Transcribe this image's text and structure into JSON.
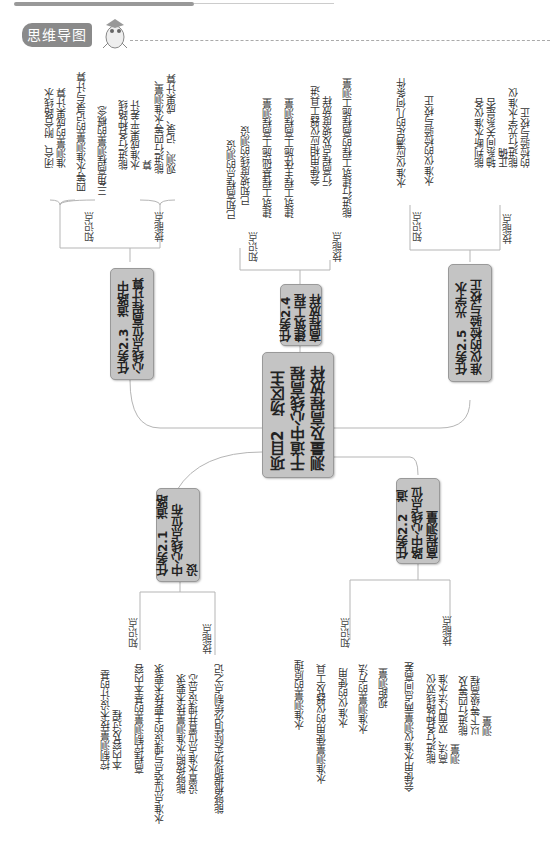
{
  "header": {
    "badge_label": "思维导图",
    "mascot_icon": "mascot-icon"
  },
  "mindmap": {
    "center": {
      "title": "项目2　场区主干道中心线高程测量及高程放样"
    },
    "tasks": [
      {
        "id": "2.3",
        "title": "任务2.3　道路中心线点位高程计算",
        "knowledge_label": "知识点",
        "skill_label": "技能点",
        "knowledge": [
          "闭合、附合路线水准测量的成果计算",
          "四等水准测量的记录与计算",
          "三角高程测量的概念"
        ],
        "skills": [
          "能进行各种路线水准成果平差计算",
          "能进行四等水准测量、观测、记录、成果计算"
        ]
      },
      {
        "id": "2.4",
        "title": "任务2.4　建筑工程高程放样",
        "knowledge_label": "知识点",
        "skill_label": "技能点",
        "knowledge": [
          "已知高程点的测设",
          "已知坡度线的测设",
          "建筑工程基础施工高程测量",
          "建筑工程主体施工高程测量"
        ],
        "skills": [
          "会使用相应仪器工具进行高程点及坡度放样",
          "能进行建筑工程的高程施工测量"
        ]
      },
      {
        "id": "2.5",
        "title": "任务2.5　光学水准仪的检验与校正",
        "knowledge_label": "知识点",
        "skill_label": "技能点",
        "knowledge": [
          "水准仪应满足的几何条件",
          "水准仪的检验与校正"
        ],
        "skills": [
          "能判断水准仪各轴系间关系是否正确",
          "能进行光学水准仪的检验与校正"
        ]
      },
      {
        "id": "2.1",
        "title": "任务2.1　道路中心线点位布设",
        "knowledge_label": "知识点",
        "skill_label": "技能点",
        "knowledge": [
          "控制测量技术设计的基本内容及过程",
          "高程控制测量的基本内容",
          "水准点位选点与埋设的主要技术要求"
        ],
        "skills": [
          "能够按照水准测量技术要求设置水准点位置并埋设点芯",
          "能够根据现场实际情况绘制点之记"
        ]
      },
      {
        "id": "2.2",
        "title": "任务2.2　道路中心线点位高程测量",
        "knowledge_label": "知识点",
        "skill_label": "技能点",
        "knowledge": [
          "水准测量的原理",
          "水准测量使用的仪器及工具",
          "水准仪的使用",
          "水准测量的方法",
          "视距测量"
        ],
        "skills": [
          "会使用水准仪测量两点间高差",
          "能进行各种路线双仪高法、双面尺法水准测量",
          "能进行四等及以下等级高程测量"
        ]
      }
    ]
  }
}
